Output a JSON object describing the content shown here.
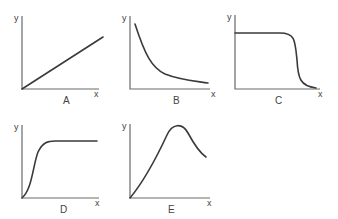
{
  "figure": {
    "panels": [
      {
        "id": "A",
        "label": "A",
        "x_axis": "x",
        "y_axis": "y",
        "shape": "linear increasing"
      },
      {
        "id": "B",
        "label": "B",
        "x_axis": "x",
        "y_axis": "y",
        "shape": "exponential/inverse decay"
      },
      {
        "id": "C",
        "label": "C",
        "x_axis": "x",
        "y_axis": "y",
        "shape": "plateau then sharp drop"
      },
      {
        "id": "D",
        "label": "D",
        "x_axis": "x",
        "y_axis": "y",
        "shape": "sigmoid rise to plateau"
      },
      {
        "id": "E",
        "label": "E",
        "x_axis": "x",
        "y_axis": "y",
        "shape": "rise to peak then decline"
      }
    ],
    "colors": {
      "axis": "#6a6a6a",
      "curve": "#3a3a3a",
      "background": "#ffffff"
    }
  }
}
